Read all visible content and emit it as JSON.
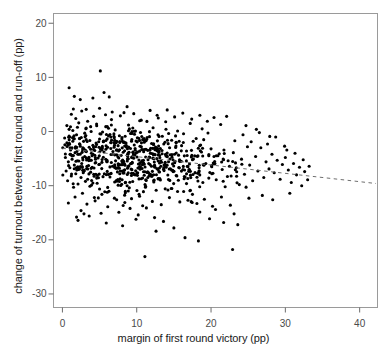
{
  "chart_data": {
    "type": "scatter",
    "title": "",
    "xlabel": "margin of first round victory (pp)",
    "ylabel": "change of turnout between first round and run-off (pp)",
    "xlim": [
      -1.2,
      42.4
    ],
    "ylim": [
      -32.5,
      21.8
    ],
    "xticks": [
      0,
      10,
      20,
      30,
      40
    ],
    "xticklabels": [
      "0",
      "10",
      "20",
      "30",
      "40"
    ],
    "yticks": [
      20,
      10,
      0,
      -10,
      -20,
      -30
    ],
    "yticklabels": [
      "20",
      "10",
      "0",
      "-10",
      "-20",
      "-30"
    ],
    "grid": false,
    "legend": null,
    "marker": {
      "shape": "circle",
      "color": "#000000",
      "size": 3.1
    },
    "n_points": 806,
    "trendline": {
      "style": "dashed",
      "color": "#6e6e6e",
      "x_start": 0.0,
      "y_start": -3.1,
      "x_end": 42.2,
      "y_end": -9.6,
      "slope": -0.154,
      "intercept": -3.1
    },
    "point_cloud_summary": {
      "x_range": [
        0.1,
        33.2
      ],
      "y_range": [
        -23.1,
        11.2
      ],
      "x_mode": 7.5,
      "y_mode": -6.0,
      "note": "dense cloud concentrated at low margins, thinning and drifting downward as margin increases"
    },
    "points": [
      [
        0.3,
        -1.2
      ],
      [
        0.4,
        -4.8
      ],
      [
        0.5,
        -7.3
      ],
      [
        0.6,
        -2.1
      ],
      [
        0.7,
        -9.1
      ],
      [
        0.8,
        -5.6
      ],
      [
        0.9,
        0.4
      ],
      [
        1.0,
        -6.7
      ],
      [
        1.1,
        -3.4
      ],
      [
        1.2,
        -8.2
      ],
      [
        1.3,
        -5.1
      ],
      [
        1.4,
        -1.8
      ],
      [
        1.5,
        -10.3
      ],
      [
        1.6,
        -6.2
      ],
      [
        1.7,
        -3.9
      ],
      [
        1.8,
        -7.8
      ],
      [
        1.9,
        -0.6
      ],
      [
        2.0,
        -5.4
      ],
      [
        2.1,
        -9.7
      ],
      [
        2.2,
        -4.2
      ],
      [
        2.3,
        -6.9
      ],
      [
        2.4,
        -2.7
      ],
      [
        2.5,
        -8.5
      ],
      [
        2.6,
        -5.9
      ],
      [
        2.7,
        -11.4
      ],
      [
        2.8,
        -3.1
      ],
      [
        2.9,
        -7.1
      ],
      [
        3.0,
        -4.6
      ],
      [
        3.1,
        -9.2
      ],
      [
        3.2,
        -1.5
      ],
      [
        3.3,
        -6.4
      ],
      [
        3.4,
        -8.8
      ],
      [
        3.5,
        -5.2
      ],
      [
        3.6,
        -2.9
      ],
      [
        3.7,
        -10.1
      ],
      [
        3.8,
        -7.5
      ],
      [
        3.9,
        -4.0
      ],
      [
        4.0,
        -6.6
      ],
      [
        4.1,
        -9.5
      ],
      [
        4.2,
        -3.3
      ],
      [
        4.3,
        -12.2
      ],
      [
        4.4,
        -5.8
      ],
      [
        4.5,
        -7.9
      ],
      [
        4.6,
        -2.4
      ],
      [
        4.7,
        -8.1
      ],
      [
        4.8,
        -4.9
      ],
      [
        4.9,
        -6.1
      ],
      [
        5.0,
        -10.6
      ],
      [
        0.9,
        8.1
      ],
      [
        1.6,
        6.5
      ],
      [
        2.4,
        5.9
      ],
      [
        3.2,
        4.1
      ],
      [
        4.1,
        6.2
      ],
      [
        5.1,
        11.2
      ],
      [
        5.6,
        7.2
      ],
      [
        6.3,
        6.4
      ],
      [
        1.2,
        3.2
      ],
      [
        1.8,
        2.4
      ],
      [
        2.6,
        3.8
      ],
      [
        3.4,
        1.9
      ],
      [
        4.2,
        2.8
      ],
      [
        5.0,
        4.3
      ],
      [
        5.8,
        3.1
      ],
      [
        6.6,
        2.2
      ],
      [
        0.6,
        1.1
      ],
      [
        1.4,
        0.2
      ],
      [
        2.2,
        1.6
      ],
      [
        3.0,
        -0.3
      ],
      [
        3.8,
        0.9
      ],
      [
        4.6,
        1.4
      ],
      [
        5.4,
        -0.1
      ],
      [
        6.2,
        0.6
      ],
      [
        0.8,
        -13.2
      ],
      [
        1.7,
        -12.1
      ],
      [
        2.5,
        -14.6
      ],
      [
        3.3,
        -13.4
      ],
      [
        4.4,
        -12.8
      ],
      [
        5.2,
        -15.1
      ],
      [
        6.1,
        -13.9
      ],
      [
        7.0,
        -12.3
      ],
      [
        1.9,
        -15.8
      ],
      [
        2.9,
        -15.2
      ],
      [
        7.6,
        -14.9
      ],
      [
        9.1,
        -14.2
      ],
      [
        10.2,
        -15.4
      ],
      [
        11.3,
        -14.1
      ],
      [
        12.4,
        -15.9
      ],
      [
        5.5,
        -1.9
      ],
      [
        6.0,
        -5.3
      ],
      [
        6.4,
        -8.4
      ],
      [
        6.8,
        -3.7
      ],
      [
        7.2,
        -6.8
      ],
      [
        7.5,
        -9.9
      ],
      [
        7.9,
        -4.4
      ],
      [
        8.3,
        -7.2
      ],
      [
        8.6,
        -2.6
      ],
      [
        9.0,
        -10.4
      ],
      [
        9.4,
        -5.7
      ],
      [
        9.8,
        -8.0
      ],
      [
        10.1,
        -3.8
      ],
      [
        10.5,
        -6.5
      ],
      [
        10.9,
        -11.1
      ],
      [
        11.2,
        -4.7
      ],
      [
        11.6,
        -7.6
      ],
      [
        12.0,
        -2.2
      ],
      [
        12.3,
        -9.3
      ],
      [
        12.7,
        -5.0
      ],
      [
        13.1,
        -8.7
      ],
      [
        13.4,
        -3.5
      ],
      [
        13.8,
        -6.3
      ],
      [
        14.2,
        -10.8
      ],
      [
        14.5,
        -4.3
      ],
      [
        14.9,
        -7.4
      ],
      [
        15.3,
        -2.0
      ],
      [
        15.6,
        -9.0
      ],
      [
        16.0,
        -5.5
      ],
      [
        16.4,
        -8.3
      ],
      [
        16.7,
        -3.6
      ],
      [
        17.1,
        -6.0
      ],
      [
        17.5,
        -11.6
      ],
      [
        17.8,
        -4.5
      ],
      [
        18.2,
        -7.7
      ],
      [
        18.6,
        -2.5
      ],
      [
        18.9,
        -9.4
      ],
      [
        19.3,
        -5.9
      ],
      [
        19.7,
        -8.6
      ],
      [
        20.0,
        -3.2
      ],
      [
        6.2,
        -0.8
      ],
      [
        7.1,
        0.3
      ],
      [
        8.0,
        -1.4
      ],
      [
        8.9,
        1.2
      ],
      [
        9.7,
        -0.5
      ],
      [
        10.6,
        2.1
      ],
      [
        11.4,
        -1.1
      ],
      [
        12.2,
        0.7
      ],
      [
        13.0,
        -0.9
      ],
      [
        13.9,
        1.8
      ],
      [
        14.7,
        -1.6
      ],
      [
        15.5,
        0.1
      ],
      [
        16.3,
        -0.4
      ],
      [
        17.2,
        1.5
      ],
      [
        18.0,
        -1.3
      ],
      [
        18.8,
        0.5
      ],
      [
        6.7,
        3.6
      ],
      [
        7.8,
        2.9
      ],
      [
        8.7,
        4.6
      ],
      [
        9.6,
        3.3
      ],
      [
        10.4,
        2.0
      ],
      [
        11.8,
        3.9
      ],
      [
        12.9,
        2.5
      ],
      [
        14.1,
        4.0
      ],
      [
        15.1,
        2.7
      ],
      [
        16.2,
        3.4
      ],
      [
        17.4,
        2.3
      ],
      [
        18.5,
        3.0
      ],
      [
        19.5,
        1.9
      ],
      [
        20.4,
        2.6
      ],
      [
        21.3,
        1.3
      ],
      [
        22.1,
        2.8
      ],
      [
        7.3,
        -12.6
      ],
      [
        8.4,
        -13.1
      ],
      [
        9.3,
        -12.4
      ],
      [
        10.8,
        -13.7
      ],
      [
        12.1,
        -12.9
      ],
      [
        13.3,
        -13.5
      ],
      [
        14.4,
        -12.2
      ],
      [
        15.8,
        -13.0
      ],
      [
        16.9,
        -12.7
      ],
      [
        18.1,
        -13.3
      ],
      [
        19.1,
        -12.5
      ],
      [
        20.2,
        -13.8
      ],
      [
        21.4,
        -12.1
      ],
      [
        22.6,
        -13.6
      ],
      [
        11.1,
        -23.1
      ],
      [
        12.6,
        -18.4
      ],
      [
        16.5,
        -19.6
      ],
      [
        18.3,
        -20.2
      ],
      [
        22.9,
        -21.8
      ],
      [
        20.6,
        -14.4
      ],
      [
        23.1,
        -15.2
      ],
      [
        20.3,
        -5.8
      ],
      [
        20.7,
        -8.9
      ],
      [
        21.1,
        -4.1
      ],
      [
        21.5,
        -7.0
      ],
      [
        21.9,
        -10.2
      ],
      [
        22.3,
        -5.4
      ],
      [
        22.7,
        -8.2
      ],
      [
        23.0,
        -3.9
      ],
      [
        23.4,
        -6.7
      ],
      [
        23.8,
        -9.8
      ],
      [
        24.1,
        -5.1
      ],
      [
        24.5,
        -7.9
      ],
      [
        24.9,
        -2.8
      ],
      [
        25.2,
        -6.2
      ],
      [
        25.6,
        -9.1
      ],
      [
        26.0,
        -4.6
      ],
      [
        26.3,
        -7.3
      ],
      [
        26.7,
        -3.0
      ],
      [
        27.1,
        -8.5
      ],
      [
        27.4,
        -5.6
      ],
      [
        27.8,
        -6.9
      ],
      [
        28.2,
        -4.2
      ],
      [
        28.5,
        -7.6
      ],
      [
        28.9,
        -5.3
      ],
      [
        29.3,
        -8.8
      ],
      [
        29.6,
        -6.1
      ],
      [
        30.0,
        -4.8
      ],
      [
        30.4,
        -7.1
      ],
      [
        30.8,
        -9.4
      ],
      [
        31.1,
        -5.9
      ],
      [
        31.5,
        -8.0
      ],
      [
        31.9,
        -6.6
      ],
      [
        32.2,
        -10.0
      ],
      [
        32.6,
        -7.4
      ],
      [
        33.0,
        -8.9
      ],
      [
        23.2,
        -1.7
      ],
      [
        24.3,
        -0.6
      ],
      [
        25.4,
        -1.9
      ],
      [
        26.5,
        -0.2
      ],
      [
        27.6,
        -2.3
      ],
      [
        28.7,
        -1.0
      ],
      [
        29.9,
        -2.7
      ],
      [
        24.7,
        1.1
      ],
      [
        26.1,
        0.4
      ],
      [
        27.9,
        -0.9
      ],
      [
        30.2,
        -3.4
      ],
      [
        31.3,
        -4.0
      ],
      [
        32.4,
        -5.2
      ],
      [
        33.2,
        -6.4
      ],
      [
        19.8,
        -16.1
      ],
      [
        21.7,
        -16.8
      ],
      [
        23.6,
        -17.2
      ],
      [
        25.1,
        -12.3
      ],
      [
        26.9,
        -11.8
      ],
      [
        28.3,
        -12.6
      ],
      [
        30.6,
        -11.4
      ],
      [
        2.1,
        -16.4
      ],
      [
        3.6,
        -15.6
      ],
      [
        5.9,
        -16.9
      ],
      [
        8.1,
        -17.4
      ],
      [
        9.9,
        -16.2
      ],
      [
        13.6,
        -16.6
      ],
      [
        15.0,
        -17.8
      ]
    ]
  },
  "figure": {
    "frame": {
      "color": "#9a9a9a"
    },
    "tick_color": "#6b6b6b",
    "tick_label_color": "#4a4a4a",
    "background": "#ffffff"
  }
}
